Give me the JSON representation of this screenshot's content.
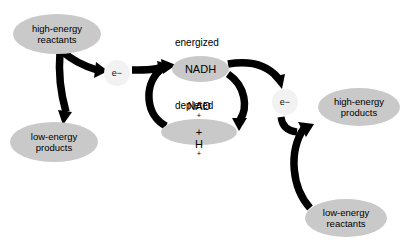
{
  "diagram": {
    "background_color": "#ffffff",
    "node_fill": "#c9c9c9",
    "electron_fill": "#f2f2f2",
    "arrow_color": "#000000",
    "nodes": [
      {
        "id": "hi-react",
        "label_line1": "high-energy",
        "label_line2": "reactants"
      },
      {
        "id": "lo-prod",
        "label_line1": "low-energy",
        "label_line2": "products"
      },
      {
        "id": "nadh",
        "label": "NADH"
      },
      {
        "id": "nad",
        "label_html": "NAD+ + H+"
      },
      {
        "id": "hi-prod",
        "label_line1": "high-energy",
        "label_line2": "products"
      },
      {
        "id": "lo-react",
        "label_line1": "low-energy",
        "label_line2": "reactants"
      }
    ],
    "electrons": [
      {
        "id": "electron-left",
        "label": "e−"
      },
      {
        "id": "electron-right",
        "label": "e−"
      }
    ],
    "captions": {
      "energized": "energized",
      "depleted": "depleted"
    },
    "nad_plus_label": {
      "nad": "NAD",
      "nad_charge": "+",
      "plus": " + ",
      "h": "H",
      "h_charge": "+"
    },
    "arrows": [
      {
        "id": "hi-react-to-electron-left",
        "from": "high-energy reactants",
        "to": "e− (left)"
      },
      {
        "id": "hi-react-to-lo-prod",
        "from": "high-energy reactants",
        "to": "low-energy products"
      },
      {
        "id": "electron-left-to-nadh",
        "from": "e− (left)",
        "to": "NADH"
      },
      {
        "id": "nad-to-nadh",
        "from": "NAD+ + H+",
        "to": "NADH"
      },
      {
        "id": "nadh-to-nad",
        "from": "NADH",
        "to": "NAD+ + H+"
      },
      {
        "id": "nadh-to-electron-right",
        "from": "NADH",
        "to": "e− (right)"
      },
      {
        "id": "electron-right-to-hi-prod",
        "from": "e− (right)",
        "to": "high-energy products"
      },
      {
        "id": "lo-react-to-hi-prod",
        "from": "low-energy reactants",
        "to": "high-energy products"
      }
    ]
  }
}
